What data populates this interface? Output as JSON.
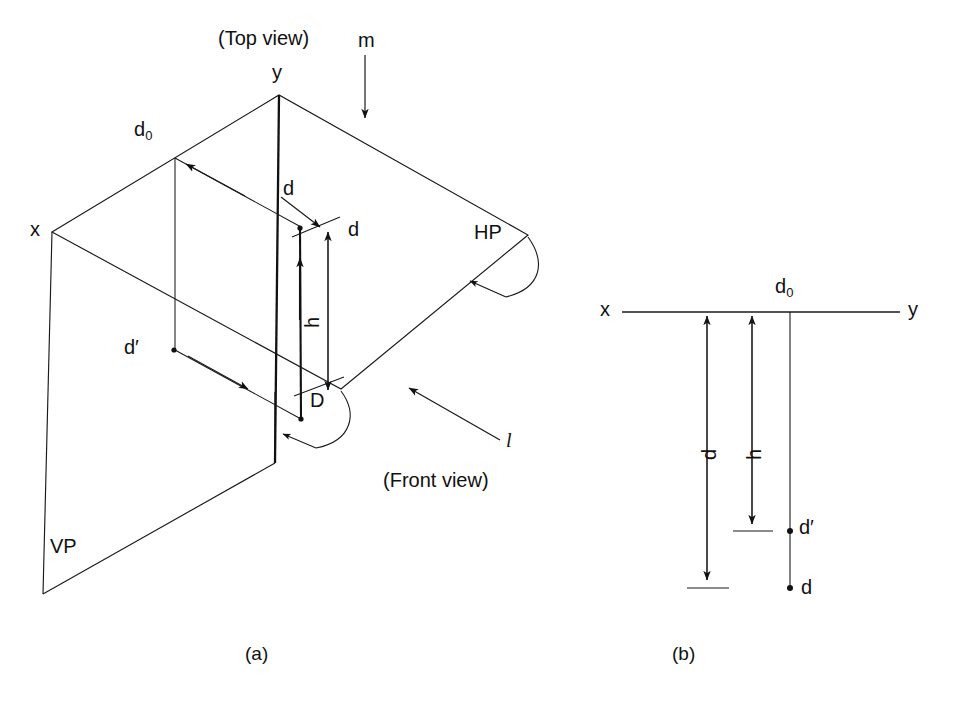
{
  "figure": {
    "title_caption_a": "(a)",
    "title_caption_b": "(b)",
    "line_color": "#1a1a1a",
    "background": "#ffffff"
  },
  "pictorial_view": {
    "caption_top_view": "(Top view)",
    "caption_front_view": "(Front view)",
    "label_m": "m",
    "label_l": "l",
    "label_x": "x",
    "label_y": "y",
    "label_HP": "HP",
    "label_VP": "VP",
    "label_D": "D",
    "label_d0_base": "d",
    "label_d0_sub": "0",
    "label_d_top": "d",
    "label_d_right": "d",
    "label_d_prime": "d′",
    "label_h": "h"
  },
  "orthographic_view": {
    "label_x": "x",
    "label_y": "y",
    "label_d0_base": "d",
    "label_d0_sub": "0",
    "label_d": "d",
    "label_h": "h",
    "label_d_prime": "d′",
    "label_d_point": "d"
  }
}
